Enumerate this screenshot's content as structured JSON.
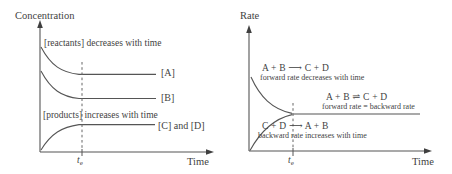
{
  "figure": {
    "background": "#ffffff",
    "ink_color": "#3f3f3f",
    "line_color": "#555555"
  },
  "left_panel": {
    "y_axis_label": "Concentration",
    "x_axis_label": "Time",
    "equilibrium_tick": {
      "base": "t",
      "sub": "e"
    },
    "reactants_annotation": "[reactants] decreases with time",
    "products_annotation": "[products] increases with time",
    "curve_labels": {
      "a": "[A]",
      "b": "[B]",
      "cd": "[C] and [D]"
    }
  },
  "right_panel": {
    "y_axis_label": "Rate",
    "x_axis_label": "Time",
    "equilibrium_tick": {
      "base": "t",
      "sub": "e"
    },
    "forward_reaction": {
      "equation": "A + B ⟶ C + D",
      "caption": "forward rate decreases with time"
    },
    "equilibrium_state": {
      "equation": "A + B ⇌ C + D",
      "caption": "forward rate = backward rate"
    },
    "backward_reaction": {
      "equation": "C + D ⟶ A + B",
      "caption": "backward rate increases with time"
    }
  }
}
